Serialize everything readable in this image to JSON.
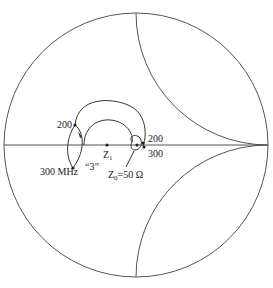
{
  "diagram": {
    "type": "smith-chart",
    "colors": {
      "stroke": "#555555",
      "text": "#222222",
      "background": "#ffffff"
    },
    "labels": {
      "top_left_freq": "200",
      "bottom_left_freq": "300 MHz",
      "loop_label": "“3”",
      "z1_main": "Z",
      "z1_sub": "1",
      "z0_main": "Z",
      "z0_sub": "0",
      "z0_value": "=50 Ω",
      "right_top_freq": "200",
      "right_bottom_freq": "300"
    },
    "chart_geometry": {
      "center": [
        136,
        145
      ],
      "radius": 132,
      "reactance_arcs": [
        "x=+1",
        "x=-1"
      ]
    }
  }
}
